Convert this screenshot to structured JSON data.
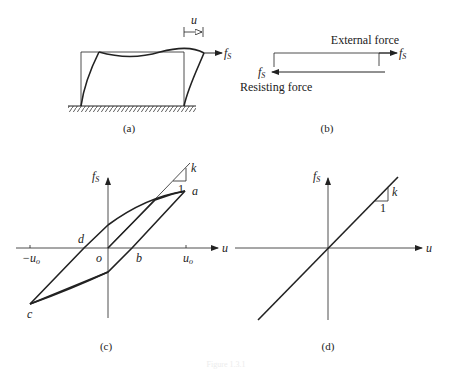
{
  "panels": {
    "a": {
      "caption": "(a)",
      "displacement_label": "u",
      "force_label_main": "f",
      "force_label_sub": "S"
    },
    "b": {
      "caption": "(b)",
      "external_force_label": "External force",
      "resisting_force_label": "Resisting force",
      "force_label_main": "f",
      "force_label_sub": "S"
    },
    "c": {
      "caption": "(c)",
      "y_axis_main": "f",
      "y_axis_sub": "S",
      "x_axis": "u",
      "point_a": "a",
      "point_b": "b",
      "point_c": "c",
      "point_d": "d",
      "point_o": "o",
      "tick_neg_main": "−u",
      "tick_neg_sub": "o",
      "tick_pos_main": "u",
      "tick_pos_sub": "o",
      "slope_k": "k",
      "slope_one": "1"
    },
    "d": {
      "caption": "(d)",
      "y_axis_main": "f",
      "y_axis_sub": "S",
      "x_axis": "u",
      "slope_k": "k",
      "slope_one": "1"
    }
  },
  "footer_caption": "Figure 1.3.1"
}
